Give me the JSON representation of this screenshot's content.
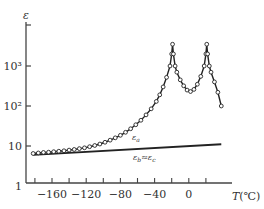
{
  "chart_data": {
    "type": "line",
    "title": "",
    "xlabel": "T(℃)",
    "ylabel": "ε",
    "yscale": "log",
    "xlim": [
      -190,
      40
    ],
    "ylim": [
      1,
      10000
    ],
    "x_ticks": [
      -160,
      -120,
      -80,
      -40,
      0
    ],
    "x_minor_ticks": [
      -180,
      -140,
      -100,
      -60,
      -20,
      20
    ],
    "y_ticks": [
      "1",
      "10",
      "10²",
      "10³"
    ],
    "y_tick_values": [
      1,
      10,
      100,
      1000
    ],
    "grid": false,
    "legend": "inline curve labels",
    "series": [
      {
        "name": "ε_a",
        "label": "εa",
        "marker": "open-circle",
        "x": [
          -182,
          -176,
          -170,
          -164,
          -158,
          -152,
          -146,
          -140,
          -134,
          -128,
          -122,
          -116,
          -110,
          -104,
          -98,
          -92,
          -86,
          -80,
          -74,
          -68,
          -62,
          -56,
          -50,
          -44,
          -38,
          -34,
          -30,
          -26,
          -22,
          -20,
          -19,
          -18,
          -16,
          -14,
          -10,
          -6,
          -2,
          2,
          6,
          10,
          14,
          18,
          20,
          21,
          22,
          24,
          26,
          30,
          34,
          38
        ],
        "values": [
          6.5,
          6.7,
          6.9,
          7.0,
          7.2,
          7.4,
          7.6,
          7.9,
          8.2,
          8.6,
          9.0,
          9.6,
          10.3,
          11.2,
          12.4,
          14,
          16,
          18.5,
          22,
          27,
          34,
          44,
          60,
          85,
          130,
          190,
          300,
          520,
          1000,
          2000,
          3500,
          2000,
          1000,
          700,
          450,
          320,
          250,
          230,
          260,
          350,
          550,
          1000,
          2000,
          3500,
          2000,
          1000,
          700,
          400,
          220,
          100
        ]
      },
      {
        "name": "ε_b ≈ ε_c",
        "label": "εb≈εc",
        "marker": "none",
        "x": [
          -182,
          38
        ],
        "values": [
          6.0,
          11.0
        ]
      }
    ],
    "annotations": [
      {
        "text": "εa",
        "x": -60,
        "y": 40
      },
      {
        "text": "εb≈εc",
        "x": -60,
        "y": 4.5
      }
    ]
  },
  "axis": {
    "y_label": "ε",
    "x_label": "T(℃)",
    "y_tick_labels": [
      "10³",
      "10²",
      "10",
      "1"
    ],
    "x_tick_labels": [
      "-160",
      "-120",
      "-80",
      "-40",
      "0"
    ]
  },
  "labels": {
    "curve_a": "ε",
    "curve_a_sub": "a",
    "curve_b": "ε",
    "curve_b_sub": "b",
    "curve_b_mid": "≈",
    "curve_c": "ε",
    "curve_c_sub": "c"
  },
  "colors": {
    "line": "#222222",
    "axis": "#444444",
    "text": "#333333",
    "marker_fill": "#ffffff"
  }
}
